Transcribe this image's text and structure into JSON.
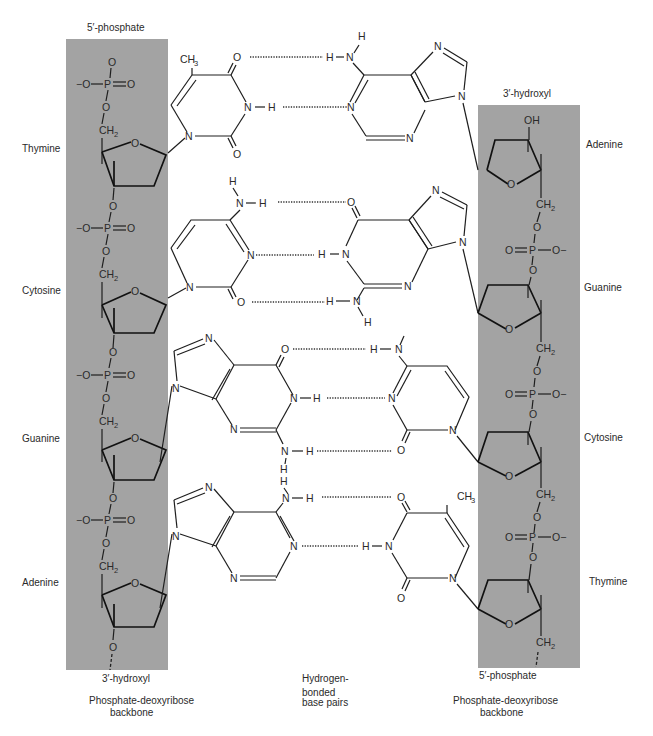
{
  "figure": {
    "colors": {
      "backbone_band": "#a3a3a3",
      "ink": "#1e1e1e",
      "background": "#ffffff"
    }
  },
  "left_strand": {
    "top_end_label": "5′-phosphate",
    "bottom_end_label": "3′-hydroxyl",
    "caption_line1": "Phosphate-deoxyribose",
    "caption_line2": "backbone",
    "bases": [
      "Thymine",
      "Cytosine",
      "Guanine",
      "Adenine"
    ]
  },
  "right_strand": {
    "top_end_label": "3′-hydroxyl",
    "bottom_end_label": "5′-phosphate",
    "caption_line1": "Phosphate-deoxyribose",
    "caption_line2": "backbone",
    "bases": [
      "Adenine",
      "Guanine",
      "Cytosine",
      "Thymine"
    ]
  },
  "center_caption": {
    "line1": "Hydrogen-",
    "line2": "bonded",
    "line3": "base pairs"
  },
  "base_pairs": [
    {
      "left": "Thymine",
      "right": "Adenine",
      "hydrogen_bonds": 2
    },
    {
      "left": "Cytosine",
      "right": "Guanine",
      "hydrogen_bonds": 3
    },
    {
      "left": "Guanine",
      "right": "Cytosine",
      "hydrogen_bonds": 3
    },
    {
      "left": "Adenine",
      "right": "Thymine",
      "hydrogen_bonds": 2
    }
  ],
  "atoms": {
    "O": "O",
    "N": "N",
    "H": "H",
    "P": "P",
    "C": "CH",
    "CH2": "CH",
    "CH3": "CH",
    "sub2": "2",
    "sub3": "3",
    "ominus": "−O",
    "ominus_r": "O−",
    "OH": "OH"
  }
}
